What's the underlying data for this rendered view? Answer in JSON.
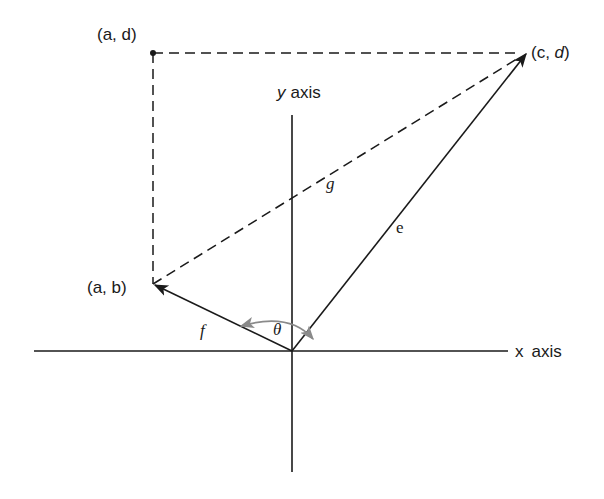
{
  "diagram": {
    "labels": {
      "point_ad": "(a, d)",
      "point_cd_prefix": "(c, ",
      "point_cd_d": "d",
      "point_cd_suffix": ")",
      "point_ab": "(a, b)",
      "y_axis_var": "y",
      "y_axis_word": "axis",
      "x_axis_var": "x",
      "x_axis_word": "axis",
      "vector_e": "e",
      "vector_f": "f",
      "vector_g": "g",
      "angle": "θ"
    },
    "colors": {
      "line": "#1a1a1a",
      "arc": "#8a8a8a"
    }
  }
}
